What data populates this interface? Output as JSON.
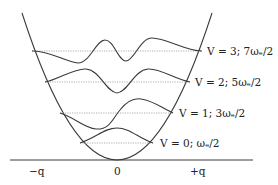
{
  "diagram": {
    "type": "harmonic-oscillator-potential-well",
    "levels": [
      {
        "v": 3,
        "label": "V = 3; 7ωₑ/2"
      },
      {
        "v": 2,
        "label": "V = 2; 5ωₑ/2"
      },
      {
        "v": 1,
        "label": "V = 1; 3ωₑ/2"
      },
      {
        "v": 0,
        "label": "V = 0; ωₑ/2"
      }
    ],
    "x_axis": {
      "ticks": [
        "−q",
        "0",
        "+q"
      ]
    },
    "colors": {
      "curve": "#3a3a3a",
      "level_line": "#9a9a9a",
      "text": "#222222"
    }
  }
}
